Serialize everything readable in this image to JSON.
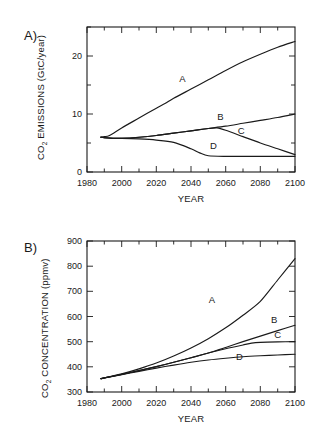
{
  "figure": {
    "background_color": "#ffffff",
    "line_color": "#1a1a1a"
  },
  "panels": [
    {
      "letter": "A)",
      "ylabel_main": "CO",
      "ylabel_sub": "2",
      "ylabel_rest": " EMISSIONS  (GtC/year)",
      "xlabel": "YEAR",
      "ytick_labels": [
        "0",
        "10",
        "20"
      ],
      "xtick_labels": [
        "1980",
        "2000",
        "2020",
        "2040",
        "2060",
        "2080",
        "2100"
      ],
      "curve_labels": [
        "A",
        "B",
        "C",
        "D"
      ]
    },
    {
      "letter": "B)",
      "ylabel_main": "CO",
      "ylabel_sub": "2",
      "ylabel_rest": " CONCENTRATION  (ppmv)",
      "xlabel": "YEAR",
      "ytick_labels": [
        "300",
        "400",
        "500",
        "600",
        "700",
        "800",
        "900"
      ],
      "xtick_labels": [
        "1980",
        "2000",
        "2020",
        "2040",
        "2060",
        "2080",
        "2100"
      ],
      "curve_labels": [
        "A",
        "B",
        "C",
        "D"
      ]
    }
  ],
  "chart_data": [
    {
      "type": "line",
      "panel": "A",
      "title": "CO2 EMISSIONS (GtC/year)",
      "xlabel": "YEAR",
      "ylabel": "CO2 EMISSIONS (GtC/year)",
      "xlim": [
        1980,
        2100
      ],
      "ylim": [
        0,
        25
      ],
      "xticks": [
        1980,
        2000,
        2020,
        2040,
        2060,
        2080,
        2100
      ],
      "yticks": [
        0,
        10,
        20
      ],
      "grid": false,
      "legend": "inline-labels",
      "series": [
        {
          "name": "A",
          "label_year": 2035,
          "label_value": 15.6,
          "x": [
            1988,
            1990,
            1993,
            2000,
            2010,
            2020,
            2025,
            2030,
            2040,
            2050,
            2060,
            2070,
            2080,
            2090,
            2100
          ],
          "y": [
            6.0,
            6.1,
            6.3,
            7.6,
            9.3,
            11.0,
            11.8,
            12.7,
            14.3,
            15.9,
            17.5,
            19.0,
            20.3,
            21.5,
            22.5
          ]
        },
        {
          "name": "B",
          "label_year": 2057,
          "label_value": 8.9,
          "x": [
            1988,
            1990,
            1995,
            2000,
            2010,
            2020,
            2030,
            2040,
            2050,
            2060,
            2070,
            2080,
            2090,
            2100
          ],
          "y": [
            6.0,
            5.9,
            5.8,
            5.8,
            6.0,
            6.3,
            6.7,
            7.1,
            7.5,
            7.9,
            8.4,
            8.9,
            9.4,
            10.0
          ]
        },
        {
          "name": "C",
          "label_year": 2069,
          "label_value": 6.5,
          "x": [
            1988,
            1990,
            1995,
            2000,
            2010,
            2020,
            2030,
            2040,
            2050,
            2055,
            2060,
            2070,
            2080,
            2090,
            2100
          ],
          "y": [
            6.0,
            5.9,
            5.8,
            5.8,
            6.0,
            6.3,
            6.7,
            7.1,
            7.5,
            7.6,
            7.2,
            6.1,
            5.0,
            4.0,
            3.0
          ]
        },
        {
          "name": "D",
          "label_year": 2053,
          "label_value": 4.0,
          "x": [
            1988,
            1990,
            1995,
            2000,
            2010,
            2020,
            2030,
            2040,
            2045,
            2050,
            2060,
            2080,
            2100
          ],
          "y": [
            6.0,
            5.9,
            5.8,
            5.8,
            5.7,
            5.5,
            5.1,
            4.0,
            3.3,
            2.8,
            2.7,
            2.7,
            2.7
          ]
        }
      ]
    },
    {
      "type": "line",
      "panel": "B",
      "title": "CO2 CONCENTRATION (ppmv)",
      "xlabel": "YEAR",
      "ylabel": "CO2 CONCENTRATION (ppmv)",
      "xlim": [
        1980,
        2100
      ],
      "ylim": [
        300,
        900
      ],
      "xticks": [
        1980,
        2000,
        2020,
        2040,
        2060,
        2080,
        2100
      ],
      "yticks": [
        300,
        400,
        500,
        600,
        700,
        800,
        900
      ],
      "grid": false,
      "legend": "inline-labels",
      "series": [
        {
          "name": "A",
          "label_year": 2052,
          "label_value": 655,
          "x": [
            1988,
            1990,
            2000,
            2010,
            2020,
            2030,
            2040,
            2050,
            2060,
            2070,
            2080,
            2090,
            2100
          ],
          "y": [
            353,
            356,
            372,
            392,
            415,
            443,
            475,
            512,
            555,
            605,
            660,
            745,
            830
          ]
        },
        {
          "name": "B",
          "label_year": 2088,
          "label_value": 573,
          "x": [
            1988,
            1990,
            2000,
            2010,
            2020,
            2030,
            2040,
            2050,
            2060,
            2070,
            2080,
            2090,
            2100
          ],
          "y": [
            353,
            356,
            370,
            385,
            401,
            418,
            436,
            455,
            477,
            500,
            522,
            544,
            565
          ]
        },
        {
          "name": "C",
          "label_year": 2090,
          "label_value": 514,
          "x": [
            1988,
            1990,
            2000,
            2010,
            2020,
            2030,
            2040,
            2050,
            2060,
            2070,
            2075,
            2080,
            2090,
            2100
          ],
          "y": [
            353,
            356,
            370,
            385,
            401,
            418,
            436,
            455,
            472,
            487,
            494,
            497,
            499,
            500
          ]
        },
        {
          "name": "D",
          "label_year": 2068,
          "label_value": 428,
          "x": [
            1988,
            1990,
            2000,
            2010,
            2020,
            2030,
            2040,
            2050,
            2060,
            2070,
            2080,
            2090,
            2100
          ],
          "y": [
            353,
            356,
            369,
            382,
            395,
            407,
            418,
            427,
            434,
            440,
            444,
            447,
            450
          ]
        }
      ]
    }
  ]
}
